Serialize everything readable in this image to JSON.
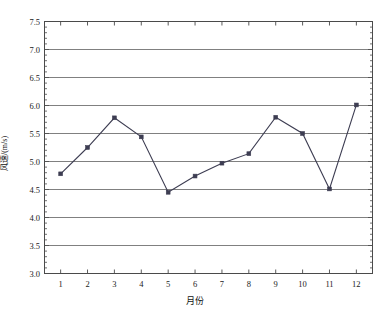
{
  "chart_data": {
    "type": "line",
    "title": "",
    "subtitle": "",
    "xlabel": "月份",
    "ylabel": "风速/(m/s)",
    "x": [
      1,
      2,
      3,
      4,
      5,
      6,
      7,
      8,
      9,
      10,
      11,
      12
    ],
    "categories": [
      "1",
      "2",
      "3",
      "4",
      "5",
      "6",
      "7",
      "8",
      "9",
      "10",
      "11",
      "12"
    ],
    "values": [
      4.78,
      5.25,
      5.78,
      5.44,
      4.45,
      4.74,
      4.97,
      5.14,
      5.79,
      5.5,
      4.51,
      6.01
    ],
    "series": [
      {
        "name": "风速",
        "values": [
          4.78,
          5.25,
          5.78,
          5.44,
          4.45,
          4.74,
          4.97,
          5.14,
          5.79,
          5.5,
          4.51,
          6.01
        ]
      }
    ],
    "xlim": [
      0.4,
      12.6
    ],
    "ylim": [
      3.0,
      7.5
    ],
    "ytick_values": [
      3.0,
      3.5,
      4.0,
      4.5,
      5.0,
      5.5,
      6.0,
      6.5,
      7.0,
      7.5
    ],
    "ytick_labels": [
      "3.0",
      "3.5",
      "4.0",
      "4.5",
      "5.0",
      "5.5",
      "6.0",
      "6.5",
      "7.0",
      "7.5"
    ],
    "xtick_values": [
      1,
      2,
      3,
      4,
      5,
      6,
      7,
      8,
      9,
      10,
      11,
      12
    ],
    "xtick_labels": [
      "1",
      "2",
      "3",
      "4",
      "5",
      "6",
      "7",
      "8",
      "9",
      "10",
      "11",
      "12"
    ],
    "y_minor_step": 0.1,
    "grid": {
      "horizontal": true,
      "vertical": false,
      "color": "#808080"
    },
    "legend": {
      "visible": false,
      "position": "none"
    },
    "line_color": "#3d3d52",
    "marker_color": "#3d3d52",
    "marker": "square",
    "frame_color": "#4a4a4a",
    "background": "#ffffff"
  }
}
